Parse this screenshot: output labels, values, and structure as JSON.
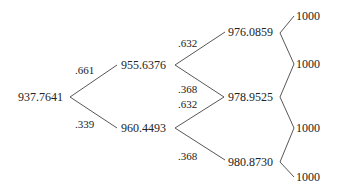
{
  "tree": {
    "root": {
      "value": "937.7641"
    },
    "level1": [
      {
        "value": "955.6376",
        "prob": ".661"
      },
      {
        "value": "960.4493",
        "prob": ".339"
      }
    ],
    "level1_up_probs": [
      ".632",
      ".368"
    ],
    "level1_down_probs": [
      ".632",
      ".368"
    ],
    "level2": [
      {
        "value": "976.0859"
      },
      {
        "value": "978.9525"
      },
      {
        "value": "980.8730"
      }
    ],
    "level3": [
      {
        "value": "1000"
      },
      {
        "value": "1000"
      },
      {
        "value": "1000"
      },
      {
        "value": "1000"
      }
    ]
  }
}
